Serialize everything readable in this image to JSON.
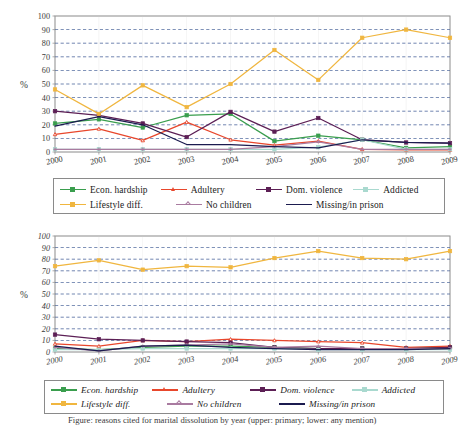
{
  "figure": {
    "caption": "Figure: reasons cited for marital dissolution by year (upper: primary; lower: any mention)"
  },
  "colors": {
    "econ_hardship": "#3a9e4e",
    "adultery": "#e8472c",
    "dom_violence": "#5c1f55",
    "addicted": "#a9d9cf",
    "lifestyle_diff": "#f0b63f",
    "no_children": "#a97ba0",
    "missing_in_prison": "#1b1b4f",
    "grid": "#2b4a8b",
    "axis": "#8a8a8a",
    "frame": "#8a8a8a"
  },
  "chart_data": [
    {
      "id": "chart-primary",
      "type": "line",
      "title": "",
      "xlabel": "",
      "ylabel": "%",
      "ylim": [
        0,
        100
      ],
      "yticks": [
        0,
        10,
        20,
        30,
        40,
        50,
        60,
        70,
        80,
        90,
        100
      ],
      "ytick_labels": [
        "0",
        "10",
        "20",
        "30",
        "40",
        "50",
        "60",
        "70",
        "80",
        "90",
        "100"
      ],
      "grid": true,
      "legend_position": "below",
      "categories": [
        "2000",
        "2001",
        "2002",
        "2003",
        "2004",
        "2005",
        "2006",
        "2007",
        "2008",
        "2009"
      ],
      "series": [
        {
          "name": "Econ. hardship",
          "color_key": "econ_hardship",
          "values": [
            21,
            24,
            18,
            27,
            28,
            8,
            12,
            9,
            3,
            4
          ]
        },
        {
          "name": "Adultery",
          "color_key": "adultery",
          "values": [
            13,
            17,
            8.5,
            22,
            9,
            5,
            8,
            2,
            1.5,
            1.5
          ]
        },
        {
          "name": "Dom. violence",
          "color_key": "dom_violence",
          "values": [
            30,
            27,
            21,
            11,
            29.5,
            15,
            25,
            9,
            7,
            6.5
          ]
        },
        {
          "name": "Addicted",
          "color_key": "addicted",
          "values": [
            2,
            2,
            2,
            2,
            2,
            2,
            3.5,
            9,
            2,
            2
          ]
        },
        {
          "name": "Lifestyle diff.",
          "color_key": "lifestyle_diff",
          "values": [
            46,
            28,
            49,
            33,
            50,
            75,
            53,
            84,
            90,
            84
          ]
        },
        {
          "name": "No children",
          "color_key": "no_children",
          "values": [
            2,
            2,
            2,
            2,
            2,
            4,
            7.5,
            2,
            2,
            2
          ]
        },
        {
          "name": "Missing/in prison",
          "color_key": "missing_in_prison",
          "values": [
            19,
            26,
            20,
            5.5,
            5.5,
            4,
            3,
            9,
            7,
            6.5
          ]
        }
      ]
    },
    {
      "id": "chart-any-mention",
      "type": "line",
      "title": "",
      "xlabel": "",
      "ylabel": "%",
      "ylim": [
        0,
        100
      ],
      "yticks": [
        0,
        10,
        20,
        30,
        40,
        50,
        60,
        70,
        80,
        90,
        100
      ],
      "ytick_labels": [
        "0",
        "10",
        "20",
        "30",
        "40",
        "50",
        "60",
        "70",
        "80",
        "90",
        "100"
      ],
      "grid": true,
      "legend_position": "below",
      "categories": [
        "2000",
        "2001",
        "2002",
        "2003",
        "2004",
        "2005",
        "2006",
        "2007",
        "2008",
        "2009"
      ],
      "series": [
        {
          "name": "Econ. hardship",
          "color_key": "econ_hardship",
          "values": [
            3,
            2,
            4,
            5,
            5,
            4,
            3,
            3,
            3,
            4
          ]
        },
        {
          "name": "Adultery",
          "color_key": "adultery",
          "values": [
            7,
            5,
            10,
            9,
            11,
            10,
            9,
            8,
            4,
            5
          ]
        },
        {
          "name": "Dom. violence",
          "color_key": "dom_violence",
          "values": [
            15,
            11,
            10,
            9,
            8,
            4,
            3,
            3,
            3,
            4
          ]
        },
        {
          "name": "Addicted",
          "color_key": "addicted",
          "values": [
            2,
            2,
            3,
            3,
            3,
            3,
            2,
            2,
            2,
            2
          ]
        },
        {
          "name": "Lifestyle diff.",
          "color_key": "lifestyle_diff",
          "values": [
            74,
            79,
            71,
            74,
            73,
            81,
            87,
            81,
            80,
            87
          ]
        },
        {
          "name": "No children",
          "color_key": "no_children",
          "values": [
            4,
            1,
            5,
            6,
            7,
            4,
            5,
            3,
            3,
            3
          ]
        },
        {
          "name": "Missing/in prison",
          "color_key": "missing_in_prison",
          "values": [
            5,
            1,
            5,
            6,
            4,
            3,
            2,
            2,
            2,
            3
          ]
        }
      ]
    }
  ],
  "legends": [
    {
      "id": "legend-primary",
      "rows": [
        [
          {
            "label": "Econ. hardship",
            "color_key": "econ_hardship",
            "marker": "square"
          },
          {
            "label": "Adultery",
            "color_key": "adultery",
            "marker": "triangle"
          },
          {
            "label": "Dom. violence",
            "color_key": "dom_violence",
            "marker": "square"
          },
          {
            "label": "Addicted",
            "color_key": "addicted",
            "marker": "square"
          }
        ],
        [
          {
            "label": "Lifestyle diff.",
            "color_key": "lifestyle_diff",
            "marker": "square"
          },
          {
            "label": "No children",
            "color_key": "no_children",
            "marker": "plus"
          },
          {
            "label": "Missing/in prison",
            "color_key": "missing_in_prison",
            "marker": "none"
          }
        ]
      ]
    },
    {
      "id": "legend-any-mention",
      "rows": [
        [
          {
            "label": "Econ. hardship",
            "color_key": "econ_hardship",
            "marker": "square"
          },
          {
            "label": "Adultery",
            "color_key": "adultery",
            "marker": "triangle"
          },
          {
            "label": "Dom. violence",
            "color_key": "dom_violence",
            "marker": "square"
          },
          {
            "label": "Addicted",
            "color_key": "addicted",
            "marker": "square"
          }
        ],
        [
          {
            "label": "Lifestyle diff.",
            "color_key": "lifestyle_diff",
            "marker": "square"
          },
          {
            "label": "No children",
            "color_key": "no_children",
            "marker": "plus"
          },
          {
            "label": "Missing/in prison",
            "color_key": "missing_in_prison",
            "marker": "none"
          }
        ]
      ]
    }
  ]
}
